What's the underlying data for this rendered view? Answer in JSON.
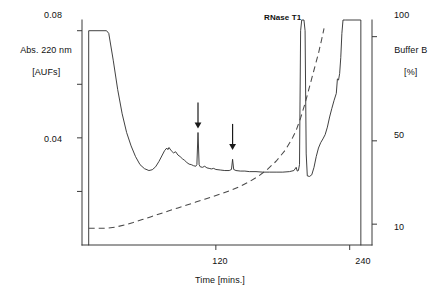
{
  "chart_data": {
    "type": "line",
    "title": "",
    "xlabel": "Time [mins.]",
    "ylabel_left": "Abs. 220 nm\n[AUFs]",
    "ylabel_right": "Buffer B\n[%]",
    "xlim": [
      0,
      260
    ],
    "ylim_left": [
      0.0,
      0.084
    ],
    "ylim_right": [
      0,
      108
    ],
    "xticks": [
      120,
      240
    ],
    "xtick_labels": [
      "120",
      "240"
    ],
    "yticks_left": [
      0.02,
      0.04,
      0.06,
      0.08
    ],
    "ytick_labels_left": [
      "",
      "0.04",
      "",
      "0.08"
    ],
    "yticks_right": [
      10,
      50,
      100
    ],
    "ytick_labels_right": [
      "10",
      "50",
      "100"
    ],
    "grid": false,
    "legend": "none",
    "annotations": [
      {
        "text": "RNase T1",
        "x": 196,
        "y": 0.081,
        "style": "bold"
      },
      {
        "text": "arrow-down",
        "x": 104,
        "y": 0.042
      },
      {
        "text": "arrow-down",
        "x": 135,
        "y": 0.034
      }
    ],
    "series": [
      {
        "name": "Abs. 220 nm",
        "style": "solid",
        "axis": "left",
        "points": [
          [
            6,
            0.0
          ],
          [
            6,
            0.08
          ],
          [
            22,
            0.08
          ],
          [
            24,
            0.079
          ],
          [
            28,
            0.069
          ],
          [
            32,
            0.058
          ],
          [
            36,
            0.049
          ],
          [
            40,
            0.042
          ],
          [
            44,
            0.037
          ],
          [
            48,
            0.033
          ],
          [
            52,
            0.03
          ],
          [
            56,
            0.0285
          ],
          [
            60,
            0.0278
          ],
          [
            63,
            0.0281
          ],
          [
            66,
            0.0292
          ],
          [
            69,
            0.0312
          ],
          [
            72,
            0.0336
          ],
          [
            74,
            0.0352
          ],
          [
            76,
            0.0362
          ],
          [
            77,
            0.0356
          ],
          [
            78,
            0.0364
          ],
          [
            80,
            0.0352
          ],
          [
            82,
            0.0344
          ],
          [
            84,
            0.0348
          ],
          [
            86,
            0.0336
          ],
          [
            88,
            0.033
          ],
          [
            90,
            0.0322
          ],
          [
            92,
            0.0316
          ],
          [
            94,
            0.0308
          ],
          [
            96,
            0.0302
          ],
          [
            98,
            0.03
          ],
          [
            100,
            0.0296
          ],
          [
            102,
            0.0294
          ],
          [
            103,
            0.03
          ],
          [
            104,
            0.042
          ],
          [
            105,
            0.03
          ],
          [
            106,
            0.0292
          ],
          [
            108,
            0.029
          ],
          [
            110,
            0.0294
          ],
          [
            112,
            0.0288
          ],
          [
            114,
            0.0286
          ],
          [
            116,
            0.0284
          ],
          [
            118,
            0.0286
          ],
          [
            120,
            0.0282
          ],
          [
            124,
            0.028
          ],
          [
            128,
            0.0278
          ],
          [
            132,
            0.0278
          ],
          [
            134,
            0.0282
          ],
          [
            135,
            0.032
          ],
          [
            136,
            0.0282
          ],
          [
            138,
            0.0278
          ],
          [
            142,
            0.0276
          ],
          [
            146,
            0.0276
          ],
          [
            150,
            0.0274
          ],
          [
            156,
            0.0274
          ],
          [
            162,
            0.0272
          ],
          [
            168,
            0.0272
          ],
          [
            174,
            0.0272
          ],
          [
            180,
            0.0272
          ],
          [
            186,
            0.0274
          ],
          [
            190,
            0.0278
          ],
          [
            192,
            0.029
          ],
          [
            193,
            0.0276
          ],
          [
            194,
            0.0278
          ],
          [
            195,
            0.03
          ],
          [
            196,
            0.08
          ],
          [
            197,
            0.084
          ],
          [
            199,
            0.084
          ],
          [
            200,
            0.08
          ],
          [
            201,
            0.034
          ],
          [
            202,
            0.0258
          ],
          [
            204,
            0.0256
          ],
          [
            206,
            0.0262
          ],
          [
            208,
            0.029
          ],
          [
            210,
            0.033
          ],
          [
            212,
            0.0362
          ],
          [
            214,
            0.0382
          ],
          [
            216,
            0.0396
          ],
          [
            218,
            0.0412
          ],
          [
            220,
            0.044
          ],
          [
            222,
            0.0478
          ],
          [
            224,
            0.051
          ],
          [
            226,
            0.054
          ],
          [
            228,
            0.0566
          ],
          [
            229,
            0.062
          ],
          [
            230,
            0.0616
          ],
          [
            231,
            0.064
          ],
          [
            232,
            0.07
          ],
          [
            233,
            0.079
          ],
          [
            234,
            0.084
          ],
          [
            236,
            0.084
          ],
          [
            250,
            0.084
          ],
          [
            250,
            0.0
          ]
        ]
      },
      {
        "name": "Buffer B",
        "style": "dashed",
        "axis": "right",
        "points": [
          [
            6,
            8
          ],
          [
            14,
            8
          ],
          [
            22,
            8
          ],
          [
            30,
            8.6
          ],
          [
            38,
            9.6
          ],
          [
            46,
            10.8
          ],
          [
            54,
            12.2
          ],
          [
            62,
            13.6
          ],
          [
            70,
            15.0
          ],
          [
            78,
            16.4
          ],
          [
            86,
            17.8
          ],
          [
            94,
            19.2
          ],
          [
            102,
            20.6
          ],
          [
            110,
            22.0
          ],
          [
            118,
            23.4
          ],
          [
            126,
            24.8
          ],
          [
            134,
            26.4
          ],
          [
            142,
            28.2
          ],
          [
            150,
            30.4
          ],
          [
            158,
            33.0
          ],
          [
            166,
            36.2
          ],
          [
            174,
            40.2
          ],
          [
            182,
            45.4
          ],
          [
            188,
            50.6
          ],
          [
            192,
            55.0
          ],
          [
            196,
            61.0
          ],
          [
            200,
            68.0
          ],
          [
            204,
            76.0
          ],
          [
            208,
            84.0
          ],
          [
            212,
            92.0
          ],
          [
            215,
            99.0
          ],
          [
            217,
            104.0
          ]
        ]
      }
    ]
  },
  "axis": {
    "left_label": "Abs. 220 nm",
    "left_label_units": "[AUFs]",
    "right_label": "Buffer B",
    "right_label_units": "[%]",
    "x_label": "Time [mins.]",
    "x_tick_120": "120",
    "x_tick_240": "240",
    "y_left_tick_008": "0.08",
    "y_left_tick_004": "0.04",
    "y_right_tick_100": "100",
    "y_right_tick_50": "50",
    "y_right_tick_10": "10"
  },
  "annotations": {
    "rnase_label": "RNase T1"
  }
}
